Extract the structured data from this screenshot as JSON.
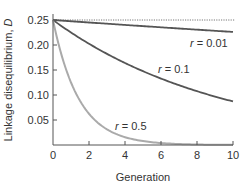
{
  "chart_data": {
    "type": "line",
    "title": "",
    "xlabel": "Generation",
    "ylabel": "Linkage disequilibrium, D",
    "ylabel_prefix": "Linkage disequilibrium, ",
    "ylabel_var": "D",
    "xlim": [
      0,
      10
    ],
    "ylim": [
      0,
      0.25
    ],
    "xticks": [
      0,
      2,
      4,
      6,
      8,
      10
    ],
    "xtick_labels": [
      "0",
      "2",
      "4",
      "6",
      "8",
      "10"
    ],
    "yticks": [
      0.05,
      0.1,
      0.15,
      0.2,
      0.25
    ],
    "ytick_labels": [
      "0.05",
      "0.10",
      "0.15",
      "0.20",
      "0.25"
    ],
    "grid": false,
    "reference_line": {
      "y": 0.25,
      "style": "dotted"
    },
    "x": [
      0,
      1,
      2,
      3,
      4,
      5,
      6,
      7,
      8,
      9,
      10
    ],
    "series": [
      {
        "name": "r = 0.01",
        "label_var": "r",
        "label_value": "= 0.01",
        "color": "#555555",
        "values": [
          0.25,
          0.2475,
          0.245,
          0.2426,
          0.2402,
          0.2378,
          0.2354,
          0.233,
          0.2307,
          0.2284,
          0.2261
        ]
      },
      {
        "name": "r = 0.1",
        "label_var": "r",
        "label_value": "= 0.1",
        "color": "#555555",
        "values": [
          0.25,
          0.225,
          0.2025,
          0.1823,
          0.164,
          0.1476,
          0.1329,
          0.1196,
          0.1076,
          0.0969,
          0.0872
        ]
      },
      {
        "name": "r = 0.5",
        "label_var": "r",
        "label_value": "= 0.5",
        "color": "#aaaaaa",
        "values": [
          0.25,
          0.125,
          0.0625,
          0.0313,
          0.0156,
          0.0078,
          0.0039,
          0.002,
          0.001,
          0.0005,
          0.0002
        ]
      }
    ],
    "legend": "inline labels"
  }
}
